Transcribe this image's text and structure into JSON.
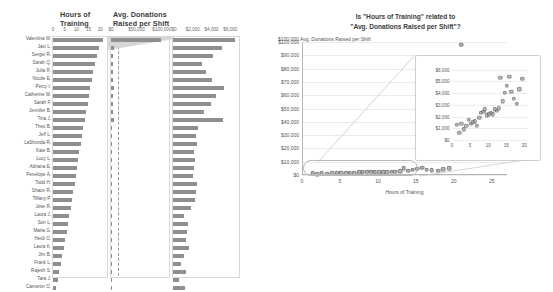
{
  "left": {
    "headers": {
      "hours": "Hours of\nTraining",
      "donations": "Avg. Donations\nRaised per Shift"
    },
    "hours_ticks": [
      "0",
      "5",
      "10",
      "15",
      "20"
    ],
    "donations_ticks": [
      "$0",
      "$50,000",
      "$100,000"
    ],
    "zoom_ticks": [
      "$0",
      "$2,000",
      "$4,000",
      "$6,000"
    ],
    "hours_axis_max": 22,
    "donations_axis_max": 110000,
    "zoom_axis_max": 6600,
    "rows": [
      {
        "name": "Valentina M.",
        "hours": 21.0,
        "donations": 98000
      },
      {
        "name": "Javi L.",
        "hours": 19.4,
        "donations": 5200
      },
      {
        "name": "Sergei R.",
        "hours": 18.6,
        "donations": 4300
      },
      {
        "name": "Sarah Q.",
        "hours": 17.9,
        "donations": 3100
      },
      {
        "name": "Julia R.",
        "hours": 17.1,
        "donations": 3500
      },
      {
        "name": "Nicole E.",
        "hours": 16.4,
        "donations": 4100
      },
      {
        "name": "Percy I.",
        "hours": 15.8,
        "donations": 5400
      },
      {
        "name": "Catherine M.",
        "hours": 15.2,
        "donations": 4600
      },
      {
        "name": "Sarah F.",
        "hours": 14.6,
        "donations": 4000
      },
      {
        "name": "Jennifer B.",
        "hours": 14.0,
        "donations": 3300
      },
      {
        "name": "Tina J.",
        "hours": 13.4,
        "donations": 5300
      },
      {
        "name": "Theo B.",
        "hours": 12.9,
        "donations": 2700
      },
      {
        "name": "Jeff L.",
        "hours": 12.3,
        "donations": 2500
      },
      {
        "name": "LaShonda R.",
        "hours": 11.8,
        "donations": 2600
      },
      {
        "name": "Kate B.",
        "hours": 11.2,
        "donations": 2200
      },
      {
        "name": "Lucy L.",
        "hours": 10.7,
        "donations": 2300
      },
      {
        "name": "Adriana E.",
        "hours": 10.2,
        "donations": 2200
      },
      {
        "name": "Penelope A.",
        "hours": 9.6,
        "donations": 2100
      },
      {
        "name": "Todd H.",
        "hours": 9.1,
        "donations": 2600
      },
      {
        "name": "Shaun R.",
        "hours": 8.6,
        "donations": 2400
      },
      {
        "name": "Tiffany P.",
        "hours": 8.0,
        "donations": 2300
      },
      {
        "name": "Jose R.",
        "hours": 7.5,
        "donations": 1900
      },
      {
        "name": "Laura J.",
        "hours": 6.9,
        "donations": 1200
      },
      {
        "name": "Son L.",
        "hours": 6.3,
        "donations": 1600
      },
      {
        "name": "Maria G.",
        "hours": 5.8,
        "donations": 1500
      },
      {
        "name": "Heidi O.",
        "hours": 5.2,
        "donations": 1400
      },
      {
        "name": "Laura K.",
        "hours": 4.6,
        "donations": 1700
      },
      {
        "name": "Jim B.",
        "hours": 4.0,
        "donations": 1200
      },
      {
        "name": "Frank L.",
        "hours": 3.3,
        "donations": 900
      },
      {
        "name": "Rajesh S.",
        "hours": 2.6,
        "donations": 1400
      },
      {
        "name": "Tara J.",
        "hours": 2.0,
        "donations": 600
      },
      {
        "name": "Cameron O.",
        "hours": 1.4,
        "donations": 1300
      }
    ]
  },
  "chart_data": {
    "type": "scatter",
    "xlabel": "Hours of Training",
    "ylabel": "$100,000 Avg. Donations Raised per Shift",
    "ylabel_text": "Avg. Donations Raised per Shift",
    "xlim": [
      0,
      27
    ],
    "ylim": [
      0,
      100000
    ],
    "xticks": [
      "0",
      "5",
      "10",
      "15",
      "20",
      "25"
    ],
    "xtick_values": [
      0,
      5,
      10,
      15,
      20,
      25
    ],
    "yticks": [
      "$0",
      "$10,000",
      "$20,000",
      "$30,000",
      "$40,000",
      "$50,000",
      "$60,000",
      "$70,000",
      "$80,000",
      "$90,000",
      "$100,000"
    ],
    "ytick_values": [
      0,
      10000,
      20000,
      30000,
      40000,
      50000,
      60000,
      70000,
      80000,
      90000,
      100000
    ],
    "grid": true,
    "points": [
      {
        "x": 21.0,
        "y": 98000
      },
      {
        "x": 19.4,
        "y": 5200
      },
      {
        "x": 18.6,
        "y": 4300
      },
      {
        "x": 17.9,
        "y": 3100
      },
      {
        "x": 17.1,
        "y": 3500
      },
      {
        "x": 16.4,
        "y": 4100
      },
      {
        "x": 15.8,
        "y": 5400
      },
      {
        "x": 15.2,
        "y": 4600
      },
      {
        "x": 14.6,
        "y": 4000
      },
      {
        "x": 14.0,
        "y": 3300
      },
      {
        "x": 13.4,
        "y": 5300
      },
      {
        "x": 12.9,
        "y": 2700
      },
      {
        "x": 12.3,
        "y": 2500
      },
      {
        "x": 11.8,
        "y": 2600
      },
      {
        "x": 11.2,
        "y": 2200
      },
      {
        "x": 10.7,
        "y": 2300
      },
      {
        "x": 10.2,
        "y": 2200
      },
      {
        "x": 9.6,
        "y": 2100
      },
      {
        "x": 9.1,
        "y": 2600
      },
      {
        "x": 8.6,
        "y": 2400
      },
      {
        "x": 8.0,
        "y": 2300
      },
      {
        "x": 7.5,
        "y": 1900
      },
      {
        "x": 6.9,
        "y": 1200
      },
      {
        "x": 6.3,
        "y": 1600
      },
      {
        "x": 5.8,
        "y": 1500
      },
      {
        "x": 5.2,
        "y": 1400
      },
      {
        "x": 4.6,
        "y": 1700
      },
      {
        "x": 4.0,
        "y": 1200
      },
      {
        "x": 3.3,
        "y": 900
      },
      {
        "x": 2.6,
        "y": 1400
      },
      {
        "x": 2.0,
        "y": 600
      },
      {
        "x": 1.4,
        "y": 1300
      }
    ],
    "inset": {
      "type": "scatter",
      "xlim": [
        0,
        21
      ],
      "ylim": [
        0,
        6300
      ],
      "xticks": [
        "0",
        "5",
        "10",
        "15",
        "20"
      ],
      "xtick_values": [
        0,
        5,
        10,
        15,
        20
      ],
      "yticks": [
        "$0",
        "$1,000",
        "$2,000",
        "$3,000",
        "$4,000",
        "$5,000",
        "$6,000"
      ],
      "ytick_values": [
        0,
        1000,
        2000,
        3000,
        4000,
        5000,
        6000
      ],
      "grid": true,
      "points": [
        {
          "x": 19.4,
          "y": 5200
        },
        {
          "x": 18.6,
          "y": 4300
        },
        {
          "x": 17.9,
          "y": 3100
        },
        {
          "x": 17.1,
          "y": 3500
        },
        {
          "x": 16.4,
          "y": 4100
        },
        {
          "x": 15.8,
          "y": 5400
        },
        {
          "x": 15.2,
          "y": 4600
        },
        {
          "x": 14.6,
          "y": 4000
        },
        {
          "x": 14.0,
          "y": 3300
        },
        {
          "x": 13.4,
          "y": 5300
        },
        {
          "x": 12.9,
          "y": 2700
        },
        {
          "x": 12.3,
          "y": 2500
        },
        {
          "x": 11.8,
          "y": 2600
        },
        {
          "x": 11.2,
          "y": 2200
        },
        {
          "x": 10.7,
          "y": 2300
        },
        {
          "x": 10.2,
          "y": 2200
        },
        {
          "x": 9.6,
          "y": 2100
        },
        {
          "x": 9.1,
          "y": 2600
        },
        {
          "x": 8.6,
          "y": 2400
        },
        {
          "x": 8.0,
          "y": 2300
        },
        {
          "x": 7.5,
          "y": 1900
        },
        {
          "x": 6.9,
          "y": 1200
        },
        {
          "x": 6.3,
          "y": 1600
        },
        {
          "x": 5.8,
          "y": 1500
        },
        {
          "x": 5.2,
          "y": 1400
        },
        {
          "x": 4.6,
          "y": 1700
        },
        {
          "x": 4.0,
          "y": 1200
        },
        {
          "x": 3.3,
          "y": 900
        },
        {
          "x": 2.6,
          "y": 1400
        },
        {
          "x": 2.0,
          "y": 600
        },
        {
          "x": 1.4,
          "y": 1300
        }
      ]
    }
  }
}
